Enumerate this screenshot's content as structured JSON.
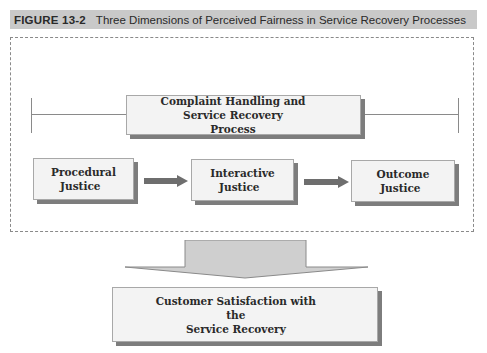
{
  "figure": {
    "label": "FIGURE 13-2",
    "title": "Three Dimensions of Perceived Fairness in Service Recovery Processes"
  },
  "diagram": {
    "process_box": {
      "line1": "Complaint Handling and Service Recovery",
      "line2": "Process"
    },
    "justice_boxes": [
      {
        "line1": "Procedural",
        "line2": "Justice"
      },
      {
        "line1": "Interactive",
        "line2": "Justice"
      },
      {
        "line1": "Outcome",
        "line2": "Justice"
      }
    ],
    "outcome_box": {
      "line1": "Customer Satisfaction with the",
      "line2": "Service Recovery"
    },
    "colors": {
      "header_bg": "#c9c9c9",
      "box_fill": "#f3f3f3",
      "box_shadow": "#7d7d7d",
      "arrow": "#6e6e6e",
      "big_arrow_fill": "#cfcfcf",
      "line": "#8a8a8a"
    }
  }
}
